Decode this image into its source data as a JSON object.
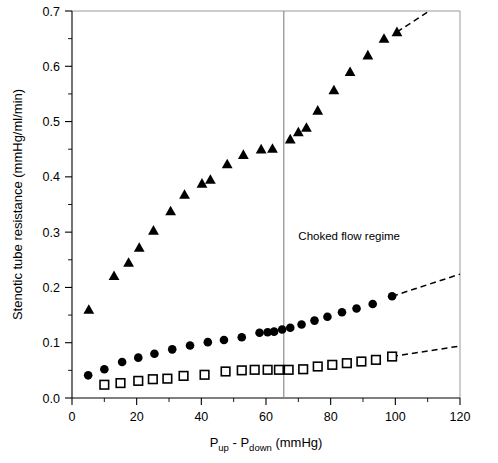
{
  "chart_data": {
    "type": "scatter",
    "title": "",
    "xlabel": "P_up - P_down (mmHg)",
    "xlabel_parts": {
      "p1": "P",
      "sub1": "up",
      "dash": " - ",
      "p2": "P",
      "sub2": "down",
      "units": " (mmHg)"
    },
    "ylabel": "Stenotic tube resistance (mmHg/ml/min)",
    "xlim": [
      0,
      120
    ],
    "ylim": [
      0.0,
      0.7
    ],
    "xticks": [
      0,
      20,
      40,
      60,
      80,
      100,
      120
    ],
    "xtick_labels": [
      "0",
      "20",
      "40",
      "60",
      "80",
      "100",
      "120"
    ],
    "xminor_step": 10,
    "yticks": [
      0.0,
      0.1,
      0.2,
      0.3,
      0.4,
      0.5,
      0.6,
      0.7
    ],
    "ytick_labels": [
      "0.0",
      "0.1",
      "0.2",
      "0.3",
      "0.4",
      "0.5",
      "0.6",
      "0.7"
    ],
    "yminor_step": 0.05,
    "grid": false,
    "legend": "none",
    "annotations": [
      {
        "name": "choked-flow-label",
        "text": "Choked flow regime",
        "x": 70,
        "y": 0.285
      }
    ],
    "reference_lines": [
      {
        "name": "choked-flow-threshold",
        "orientation": "vertical",
        "x": 65.5,
        "color": "#8c8c8c"
      }
    ],
    "series": [
      {
        "name": "Triangles (largest stenosis)",
        "marker": "triangle",
        "color": "#000000",
        "points": [
          [
            5.2,
            0.16
          ],
          [
            13.0,
            0.221
          ],
          [
            17.5,
            0.245
          ],
          [
            20.8,
            0.272
          ],
          [
            25.2,
            0.303
          ],
          [
            30.5,
            0.338
          ],
          [
            34.8,
            0.368
          ],
          [
            40.2,
            0.388
          ],
          [
            42.8,
            0.395
          ],
          [
            48.0,
            0.423
          ],
          [
            53.0,
            0.44
          ],
          [
            58.5,
            0.45
          ],
          [
            62.0,
            0.451
          ],
          [
            67.5,
            0.468
          ],
          [
            70.0,
            0.481
          ],
          [
            72.5,
            0.489
          ],
          [
            76.0,
            0.52
          ],
          [
            81.0,
            0.557
          ],
          [
            86.0,
            0.59
          ],
          [
            91.5,
            0.62
          ],
          [
            96.5,
            0.65
          ],
          [
            100.5,
            0.662
          ]
        ],
        "trend_dash": {
          "x1": 100.5,
          "y1": 0.662,
          "x2": 110.5,
          "y2": 0.7
        }
      },
      {
        "name": "Circles (intermediate stenosis)",
        "marker": "circle",
        "color": "#000000",
        "points": [
          [
            5.0,
            0.041
          ],
          [
            10.0,
            0.052
          ],
          [
            15.5,
            0.065
          ],
          [
            20.5,
            0.073
          ],
          [
            25.5,
            0.08
          ],
          [
            31.0,
            0.088
          ],
          [
            36.5,
            0.095
          ],
          [
            42.0,
            0.101
          ],
          [
            47.0,
            0.105
          ],
          [
            52.5,
            0.11
          ],
          [
            58.0,
            0.118
          ],
          [
            60.5,
            0.119
          ],
          [
            62.5,
            0.12
          ],
          [
            65.0,
            0.124
          ],
          [
            67.5,
            0.127
          ],
          [
            71.0,
            0.133
          ],
          [
            75.0,
            0.14
          ],
          [
            79.0,
            0.147
          ],
          [
            83.5,
            0.155
          ],
          [
            88.0,
            0.162
          ],
          [
            93.0,
            0.17
          ],
          [
            99.0,
            0.184
          ]
        ],
        "trend_dash": {
          "x1": 99.0,
          "y1": 0.184,
          "x2": 120.0,
          "y2": 0.224
        }
      },
      {
        "name": "Squares (smallest stenosis)",
        "marker": "square",
        "color": "#000000",
        "points": [
          [
            10.0,
            0.024
          ],
          [
            15.0,
            0.027
          ],
          [
            20.5,
            0.031
          ],
          [
            25.0,
            0.034
          ],
          [
            29.5,
            0.035
          ],
          [
            34.5,
            0.04
          ],
          [
            41.0,
            0.042
          ],
          [
            47.5,
            0.048
          ],
          [
            52.5,
            0.05
          ],
          [
            56.5,
            0.051
          ],
          [
            60.5,
            0.051
          ],
          [
            64.0,
            0.051
          ],
          [
            67.0,
            0.051
          ],
          [
            71.5,
            0.052
          ],
          [
            76.0,
            0.057
          ],
          [
            80.5,
            0.06
          ],
          [
            85.0,
            0.063
          ],
          [
            89.5,
            0.066
          ],
          [
            94.0,
            0.069
          ],
          [
            99.0,
            0.075
          ]
        ],
        "trend_dash": {
          "x1": 99.0,
          "y1": 0.075,
          "x2": 120.0,
          "y2": 0.094
        }
      }
    ]
  },
  "figure": {
    "width": 498,
    "height": 463,
    "background": "#ffffff"
  }
}
